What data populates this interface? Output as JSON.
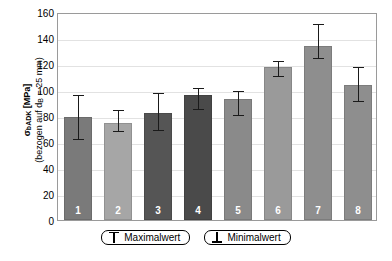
{
  "chart_data": {
    "type": "bar",
    "title": "",
    "xlabel": "",
    "ylabel": "σbADK [MPa] (bezogen auf dB = 25 mm)",
    "ylabel_line1": "σbADK [MPa]",
    "ylabel_line2": "(bezogen auf dB = 25 mm)",
    "ylim": [
      0,
      160
    ],
    "ytick_step": 20,
    "yticks": [
      160,
      140,
      120,
      100,
      80,
      60,
      40,
      20,
      0
    ],
    "grid": true,
    "legend_position": "bottom",
    "categories": [
      "1",
      "2",
      "3",
      "4",
      "5",
      "6",
      "7",
      "8"
    ],
    "values": [
      79,
      75,
      82,
      96,
      93,
      118,
      134,
      104
    ],
    "err_max": [
      98,
      86,
      99,
      103,
      101,
      124,
      152,
      119
    ],
    "err_min": [
      64,
      70,
      71,
      87,
      82,
      112,
      126,
      93
    ],
    "bar_colors": [
      "#7a7a7a",
      "#a6a6a6",
      "#555555",
      "#4a4a4a",
      "#8a8a8a",
      "#9a9a9a",
      "#8e8e8e",
      "#8e8e8e"
    ],
    "legend": [
      {
        "name": "maximalwert",
        "label": "Maximalwert",
        "glyph": "top-cap-icon"
      },
      {
        "name": "minimalwert",
        "label": "Minimalwert",
        "glyph": "bottom-cap-icon"
      }
    ]
  }
}
